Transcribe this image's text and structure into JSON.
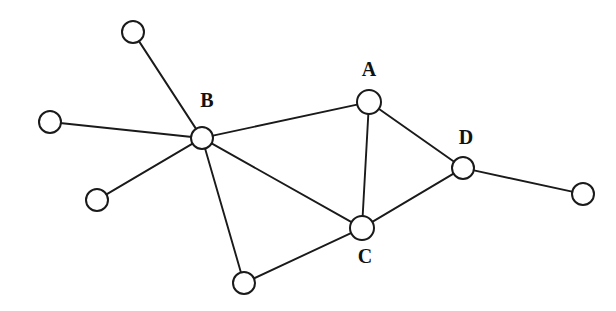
{
  "diagram": {
    "background_color": "#ffffff",
    "stroke_color": "#1a1a1a",
    "node_fill_color": "#ffffff",
    "label_color": "#111111",
    "node_radius": 11,
    "canvas": {
      "width": 616,
      "height": 311
    },
    "nodes": [
      {
        "id": "n1",
        "label": "",
        "x": 133,
        "y": 32,
        "r": 11,
        "labeled": false
      },
      {
        "id": "n2",
        "label": "",
        "x": 50,
        "y": 122,
        "r": 11,
        "labeled": false
      },
      {
        "id": "n3",
        "label": "",
        "x": 97,
        "y": 200,
        "r": 11,
        "labeled": false
      },
      {
        "id": "B",
        "label": "B",
        "x": 202,
        "y": 138,
        "r": 11,
        "labeled": true,
        "label_x": 207,
        "label_y": 102
      },
      {
        "id": "n4",
        "label": "",
        "x": 244,
        "y": 283,
        "r": 11,
        "labeled": false
      },
      {
        "id": "A",
        "label": "A",
        "x": 369,
        "y": 102,
        "r": 12,
        "labeled": true,
        "label_x": 369,
        "label_y": 71
      },
      {
        "id": "C",
        "label": "C",
        "x": 362,
        "y": 228,
        "r": 12,
        "labeled": true,
        "label_x": 365,
        "label_y": 258
      },
      {
        "id": "D",
        "label": "D",
        "x": 463,
        "y": 168,
        "r": 11,
        "labeled": true,
        "label_x": 466,
        "label_y": 139
      },
      {
        "id": "n5",
        "label": "",
        "x": 583,
        "y": 194,
        "r": 11,
        "labeled": false
      }
    ],
    "edges": [
      {
        "from": "n1",
        "to": "B"
      },
      {
        "from": "n2",
        "to": "B"
      },
      {
        "from": "n3",
        "to": "B"
      },
      {
        "from": "B",
        "to": "n4"
      },
      {
        "from": "B",
        "to": "A"
      },
      {
        "from": "B",
        "to": "C"
      },
      {
        "from": "n4",
        "to": "C"
      },
      {
        "from": "A",
        "to": "C"
      },
      {
        "from": "A",
        "to": "D"
      },
      {
        "from": "C",
        "to": "D"
      },
      {
        "from": "D",
        "to": "n5"
      }
    ]
  }
}
